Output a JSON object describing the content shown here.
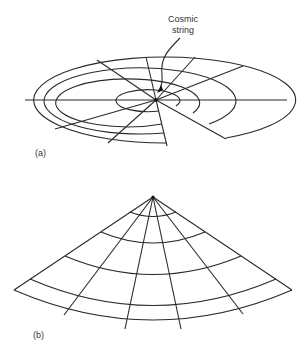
{
  "figure": {
    "panels": [
      {
        "id": "a",
        "label": "(a)",
        "description": "Flat polar grid disk with a wedge removed; grid centered on cosmic string",
        "annotation": {
          "line1": "Cosmic",
          "line2": "string"
        }
      },
      {
        "id": "b",
        "label": "(b)",
        "description": "Same grid rolled into a cone after the missing wedge is closed; apex at cosmic string"
      }
    ],
    "colors": {
      "line": "#2a2a2a",
      "background": "#ffffff"
    }
  }
}
